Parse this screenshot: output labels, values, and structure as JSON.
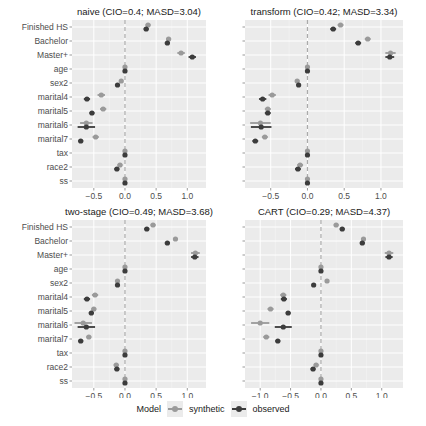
{
  "chart_data": {
    "type": "scatter",
    "subtype": "coefficient plot (point estimate with confidence interval), faceted 2x2",
    "variables": [
      "Finished HS",
      "Bachelor",
      "Master+",
      "age",
      "sex2",
      "marital4",
      "marital5",
      "marital6",
      "marital7",
      "tax",
      "race2",
      "ss"
    ],
    "xlabel": "",
    "ylabel": "",
    "grid": true,
    "reference_line": {
      "x": 0,
      "style": "dashed"
    },
    "legend": {
      "position": "bottom",
      "title": "Model",
      "entries": [
        "synthetic",
        "observed"
      ]
    },
    "colors": {
      "synthetic": "#9a9a9a",
      "observed": "#3c3c3c",
      "panel_bg": "#ebebeb",
      "grid": "#ffffff",
      "refline": "#aaaaaa"
    },
    "panels": [
      {
        "title": "naive (CIO=0.4; MASD=3.04)",
        "method": "naive",
        "CIO": 0.4,
        "MASD": 3.04,
        "xlim": [
          -0.85,
          1.3
        ],
        "xticks": [
          -0.5,
          0.0,
          0.5,
          1.0
        ],
        "xtick_labels": [
          "-0.5",
          "0.0",
          "0.5",
          "1.0"
        ],
        "series": [
          {
            "name": "synthetic",
            "estimate": [
              0.37,
              0.7,
              0.9,
              0.0,
              -0.06,
              -0.38,
              -0.35,
              -0.62,
              -0.47,
              0.0,
              -0.08,
              0.0
            ],
            "ci_low": [
              0.33,
              0.66,
              0.84,
              -0.02,
              -0.09,
              -0.44,
              -0.4,
              -0.72,
              -0.52,
              -0.02,
              -0.12,
              -0.02
            ],
            "ci_high": [
              0.41,
              0.74,
              0.96,
              0.02,
              -0.03,
              -0.32,
              -0.3,
              -0.52,
              -0.42,
              0.02,
              -0.04,
              0.02
            ]
          },
          {
            "name": "observed",
            "estimate": [
              0.34,
              0.68,
              1.08,
              0.0,
              -0.12,
              -0.61,
              -0.53,
              -0.62,
              -0.71,
              0.0,
              -0.13,
              0.0
            ],
            "ci_low": [
              0.3,
              0.64,
              1.02,
              -0.02,
              -0.15,
              -0.66,
              -0.57,
              -0.76,
              -0.75,
              -0.02,
              -0.17,
              -0.02
            ],
            "ci_high": [
              0.38,
              0.72,
              1.14,
              0.02,
              -0.09,
              -0.56,
              -0.49,
              -0.48,
              -0.67,
              0.02,
              -0.09,
              0.02
            ]
          }
        ]
      },
      {
        "title": "transform (CIO=0.42; MASD=3.34)",
        "method": "transform",
        "CIO": 0.42,
        "MASD": 3.34,
        "xlim": [
          -0.85,
          1.3
        ],
        "xticks": [
          -0.5,
          0.0,
          0.5,
          1.0
        ],
        "xtick_labels": [
          "-0.5",
          "0.0",
          "0.5",
          "1.0"
        ],
        "series": [
          {
            "name": "synthetic",
            "estimate": [
              0.45,
              0.82,
              1.13,
              0.0,
              -0.14,
              -0.48,
              -0.54,
              -0.64,
              -0.58,
              0.0,
              -0.1,
              0.0
            ],
            "ci_low": [
              0.41,
              0.78,
              1.06,
              -0.02,
              -0.17,
              -0.53,
              -0.58,
              -0.78,
              -0.62,
              -0.02,
              -0.14,
              -0.02
            ],
            "ci_high": [
              0.49,
              0.86,
              1.2,
              0.02,
              -0.11,
              -0.43,
              -0.5,
              -0.5,
              -0.54,
              0.02,
              -0.06,
              0.02
            ]
          },
          {
            "name": "observed",
            "estimate": [
              0.35,
              0.69,
              1.12,
              0.0,
              -0.12,
              -0.61,
              -0.54,
              -0.63,
              -0.71,
              0.0,
              -0.13,
              0.0
            ],
            "ci_low": [
              0.31,
              0.65,
              1.06,
              -0.02,
              -0.15,
              -0.66,
              -0.58,
              -0.77,
              -0.75,
              -0.02,
              -0.17,
              -0.02
            ],
            "ci_high": [
              0.39,
              0.73,
              1.18,
              0.02,
              -0.09,
              -0.56,
              -0.5,
              -0.49,
              -0.67,
              0.02,
              -0.09,
              0.02
            ]
          }
        ]
      },
      {
        "title": "two-stage (CIO=0.49; MASD=3.68)",
        "method": "two-stage",
        "CIO": 0.49,
        "MASD": 3.68,
        "xlim": [
          -0.85,
          1.3
        ],
        "xticks": [
          -0.5,
          0.0,
          0.5,
          1.0
        ],
        "xtick_labels": [
          "-0.5",
          "0.0",
          "0.5",
          "1.0"
        ],
        "series": [
          {
            "name": "synthetic",
            "estimate": [
              0.45,
              0.81,
              1.13,
              0.0,
              -0.12,
              -0.48,
              -0.5,
              -0.67,
              -0.58,
              0.0,
              -0.14,
              0.0
            ],
            "ci_low": [
              0.41,
              0.77,
              1.06,
              -0.02,
              -0.15,
              -0.53,
              -0.54,
              -0.81,
              -0.62,
              -0.02,
              -0.18,
              -0.02
            ],
            "ci_high": [
              0.49,
              0.85,
              1.2,
              0.02,
              -0.09,
              -0.43,
              -0.46,
              -0.53,
              -0.54,
              0.02,
              -0.1,
              0.02
            ]
          },
          {
            "name": "observed",
            "estimate": [
              0.35,
              0.68,
              1.12,
              0.0,
              -0.12,
              -0.61,
              -0.54,
              -0.62,
              -0.71,
              0.0,
              -0.13,
              0.0
            ],
            "ci_low": [
              0.31,
              0.64,
              1.06,
              -0.02,
              -0.15,
              -0.66,
              -0.58,
              -0.76,
              -0.75,
              -0.02,
              -0.17,
              -0.02
            ],
            "ci_high": [
              0.39,
              0.72,
              1.18,
              0.02,
              -0.09,
              -0.56,
              -0.5,
              -0.48,
              -0.67,
              0.02,
              -0.09,
              0.02
            ]
          }
        ]
      },
      {
        "title": "CART (CIO=0.29; MASD=4.37)",
        "method": "CART",
        "CIO": 0.29,
        "MASD": 4.37,
        "xlim": [
          -1.25,
          1.35
        ],
        "xticks": [
          -1.0,
          -0.5,
          0.0,
          0.5,
          1.0
        ],
        "xtick_labels": [
          "-1.0",
          "-0.5",
          "0.0",
          "0.5",
          "1.0"
        ],
        "series": [
          {
            "name": "synthetic",
            "estimate": [
              0.25,
              0.7,
              1.12,
              0.0,
              0.1,
              -0.62,
              -0.83,
              -1.0,
              -0.9,
              0.0,
              -0.08,
              0.0
            ],
            "ci_low": [
              0.21,
              0.66,
              1.05,
              -0.02,
              0.07,
              -0.67,
              -0.88,
              -1.15,
              -0.95,
              -0.02,
              -0.12,
              -0.02
            ],
            "ci_high": [
              0.29,
              0.74,
              1.19,
              0.02,
              0.13,
              -0.57,
              -0.78,
              -0.85,
              -0.85,
              0.02,
              -0.04,
              0.02
            ]
          },
          {
            "name": "observed",
            "estimate": [
              0.35,
              0.68,
              1.12,
              0.0,
              -0.12,
              -0.61,
              -0.54,
              -0.62,
              -0.71,
              0.0,
              -0.13,
              0.0
            ],
            "ci_low": [
              0.31,
              0.64,
              1.06,
              -0.02,
              -0.15,
              -0.66,
              -0.58,
              -0.76,
              -0.75,
              -0.02,
              -0.17,
              -0.02
            ],
            "ci_high": [
              0.39,
              0.72,
              1.18,
              0.02,
              -0.09,
              -0.56,
              -0.5,
              -0.48,
              -0.67,
              0.02,
              -0.09,
              0.02
            ]
          }
        ]
      }
    ]
  },
  "legend": {
    "title": "Model",
    "items": [
      {
        "label": "synthetic",
        "color": "#9a9a9a"
      },
      {
        "label": "observed",
        "color": "#3c3c3c"
      }
    ]
  }
}
